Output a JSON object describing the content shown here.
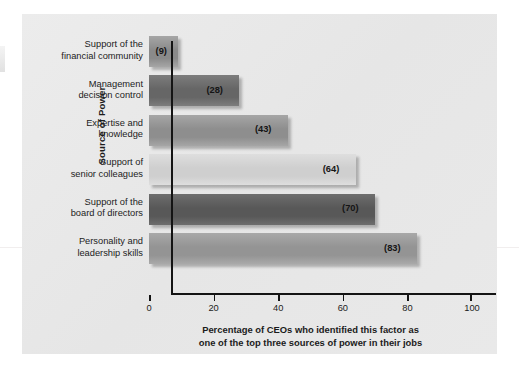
{
  "chart_data": {
    "type": "bar",
    "orientation": "horizontal",
    "title": "",
    "categories": [
      "Support of the financial community",
      "Management decision control",
      "Expertise and knowledge",
      "Support of senior colleagues",
      "Support of the board of directors",
      "Personality and leadership skills"
    ],
    "category_lines": [
      [
        "Support of the",
        "financial community"
      ],
      [
        "Management",
        "decision control"
      ],
      [
        "Expertise and",
        "knowledge"
      ],
      [
        "Support of",
        "senior colleagues"
      ],
      [
        "Support of the",
        "board of directors"
      ],
      [
        "Personality and",
        "leadership skills"
      ]
    ],
    "values": [
      9,
      28,
      43,
      64,
      70,
      83
    ],
    "value_labels": [
      "(9)",
      "(28)",
      "(43)",
      "(64)",
      "(70)",
      "(83)"
    ],
    "bar_colors": [
      "#8a8a8a",
      "#666666",
      "#8e8e8e",
      "#cfcfcf",
      "#585858",
      "#949494"
    ],
    "bar_colors_light": [
      "#a6a6a6",
      "#7d7d7d",
      "#a6a6a6",
      "#dedede",
      "#6e6e6e",
      "#a9a9a9"
    ],
    "xlabel_lines": [
      "Percentage of CEOs who identified this factor as",
      "one of the top three sources of power in their jobs"
    ],
    "xlabel": "Percentage of CEOs who identified this factor as one of the top three sources of power in their jobs",
    "ylabel": "Source of Power",
    "xticks": [
      0,
      20,
      40,
      60,
      80,
      100
    ],
    "xtick_labels": [
      "0",
      "20",
      "40",
      "60",
      "80",
      "100"
    ],
    "xlim": [
      0,
      100
    ],
    "grid": false,
    "legend": false,
    "background_color": "#e9e9e9",
    "axis_color": "#141414",
    "text_color": "#1c1c1c"
  }
}
